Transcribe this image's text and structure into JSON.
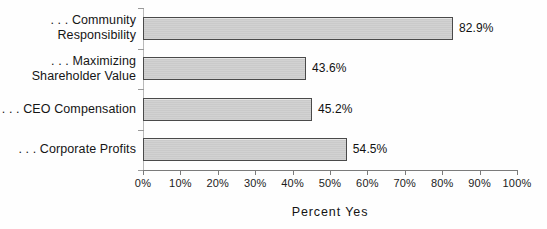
{
  "chart_data": {
    "type": "bar",
    "orientation": "horizontal",
    "title": "",
    "xlabel": "Percent Yes",
    "ylabel": "",
    "xlim": [
      0,
      100
    ],
    "grid": false,
    "legend": null,
    "categories": [
      ". . . Community\nResponsibility",
      ". . . Maximizing\nShareholder Value",
      ". . . CEO Compensation",
      ". . . Corporate Profits"
    ],
    "values": [
      82.9,
      43.6,
      45.2,
      54.5
    ],
    "value_labels": [
      "82.9%",
      "43.6%",
      "45.2%",
      "54.5%"
    ],
    "xticks": [
      0,
      10,
      20,
      30,
      40,
      50,
      60,
      70,
      80,
      90,
      100
    ],
    "xtick_labels": [
      "0%",
      "10%",
      "20%",
      "30%",
      "40%",
      "50%",
      "60%",
      "70%",
      "80%",
      "90%",
      "100%"
    ],
    "colors": {
      "bar_fill": "#cfcfcf",
      "bar_border": "#4a4a4a",
      "axis": "#7b7b7b",
      "text": "#151515",
      "background": "#fefefe"
    }
  }
}
